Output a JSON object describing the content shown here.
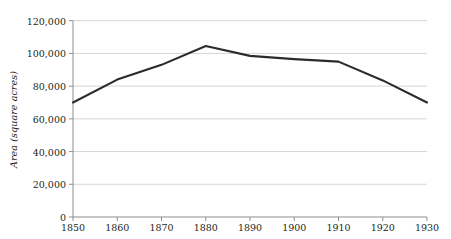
{
  "chart_data": {
    "type": "line",
    "title": "",
    "xlabel": "",
    "ylabel": "Area (square acres)",
    "x": [
      1850,
      1860,
      1870,
      1880,
      1890,
      1900,
      1910,
      1920,
      1930
    ],
    "values": [
      70000,
      84000,
      93000,
      104500,
      98500,
      96500,
      95000,
      83500,
      70000
    ],
    "series": [
      {
        "name": "Area",
        "values": [
          70000,
          84000,
          93000,
          104500,
          98500,
          96500,
          95000,
          83500,
          70000
        ]
      }
    ],
    "xtick_labels": [
      "1850",
      "1860",
      "1870",
      "1880",
      "1890",
      "1900",
      "1910",
      "1920",
      "1930"
    ],
    "ytick_labels": [
      "0",
      "20,000",
      "40,000",
      "60,000",
      "80,000",
      "100,000",
      "120,000"
    ],
    "ytick_values": [
      0,
      20000,
      40000,
      60000,
      80000,
      100000,
      120000
    ],
    "xlim": [
      1850,
      1930
    ],
    "ylim": [
      0,
      120000
    ],
    "grid": "horizontal",
    "legend": "none",
    "line_color": "#2b2b2b",
    "grid_color": "#d6d6d6",
    "axis_color": "#8d8d8d",
    "text_color": "#231f20"
  }
}
